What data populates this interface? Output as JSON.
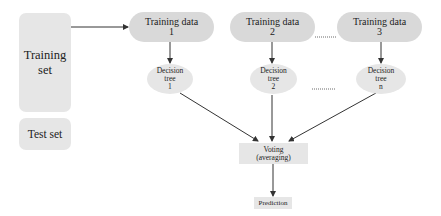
{
  "diagram": {
    "left": {
      "training_set": "Training\nset",
      "test_set": "Test set"
    },
    "training_data": [
      {
        "label": "Training data\n1"
      },
      {
        "label": "Training data\n2"
      },
      {
        "label": "Training data\n3"
      }
    ],
    "decision_trees": [
      {
        "label": "Decision\ntree\n1"
      },
      {
        "label": "Decision\ntree\n2"
      },
      {
        "label": "Decision\ntree\nn"
      }
    ],
    "voting": "Voting\n(averaging)",
    "prediction": "Prediction",
    "colors": {
      "set_fill": "#e6e6e6",
      "pill_fill": "#d9d9d9",
      "node_fill": "#e6e6e6",
      "edge": "#333333"
    }
  }
}
